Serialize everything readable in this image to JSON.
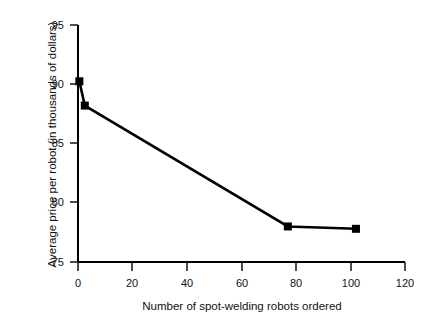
{
  "chart_data": {
    "type": "line",
    "title": "",
    "subtitle": "",
    "xlabel": "Number of spot-welding robots ordered",
    "ylabel": "Average price per robot (in thousands of dollars)",
    "xlim": [
      0,
      120
    ],
    "ylim": [
      75,
      95
    ],
    "xticks": [
      0,
      20,
      40,
      60,
      80,
      100,
      120
    ],
    "yticks": [
      75,
      80,
      85,
      90,
      95
    ],
    "xtick_labels": [
      "0",
      "20",
      "40",
      "60",
      "80",
      "100",
      "120"
    ],
    "ytick_labels": [
      "75",
      "80",
      "85",
      "90",
      "95"
    ],
    "grid": false,
    "legend": false,
    "legend_position": "none",
    "marker": "square",
    "line_color": "#000000",
    "marker_color": "#000000",
    "series": [
      {
        "name": "Average price per robot",
        "x": [
          0.5,
          2.5,
          77,
          102
        ],
        "values": [
          90.25,
          88.2,
          78.0,
          77.8
        ],
        "points": [
          {
            "x": 0.5,
            "y": 90.25
          },
          {
            "x": 2.5,
            "y": 88.2
          },
          {
            "x": 77,
            "y": 78.0
          },
          {
            "x": 102,
            "y": 77.8
          }
        ]
      }
    ]
  }
}
